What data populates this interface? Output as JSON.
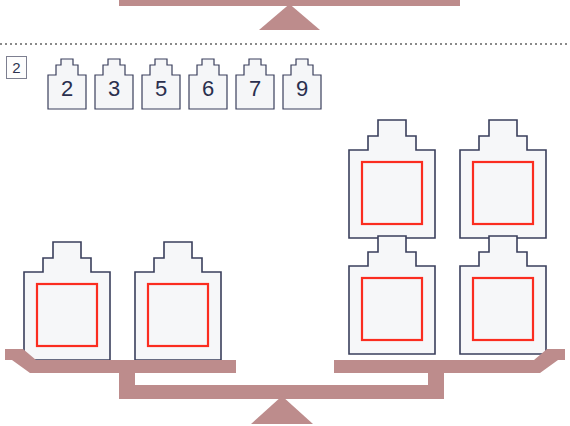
{
  "page": {
    "width": 570,
    "height": 426,
    "background": "#ffffff",
    "type": "math-worksheet-balance-puzzle"
  },
  "colors": {
    "beam": "#bd8c8c",
    "weight_outline": "#3a3f5c",
    "weight_fill": "#f6f7f9",
    "inner_square": "#fb2d20",
    "separator": "#8a8a8a",
    "number_text": "#2a2f4e"
  },
  "previous_exercise": {
    "label": "cut-off-balance-from-previous-question",
    "visible": "bottom of beam and fulcrum only"
  },
  "separator": {
    "style": "dotted-horizontal-rule"
  },
  "question": {
    "number": "2"
  },
  "number_tiles": [
    {
      "value": "2"
    },
    {
      "value": "3"
    },
    {
      "value": "5"
    },
    {
      "value": "6"
    },
    {
      "value": "7"
    },
    {
      "value": "9"
    }
  ],
  "balance": {
    "fulcrum": "triangle",
    "left_pan": {
      "name": "left-pan",
      "weight_count": 2,
      "stacks": [
        {
          "name": "left-stack-1",
          "height": 1,
          "weights": [
            {
              "value": ""
            }
          ]
        },
        {
          "name": "left-stack-2",
          "height": 1,
          "weights": [
            {
              "value": ""
            }
          ]
        }
      ]
    },
    "right_pan": {
      "name": "right-pan",
      "weight_count": 4,
      "stacks": [
        {
          "name": "right-stack-1",
          "height": 2,
          "weights": [
            {
              "value": ""
            },
            {
              "value": ""
            }
          ]
        },
        {
          "name": "right-stack-2",
          "height": 2,
          "weights": [
            {
              "value": ""
            },
            {
              "value": ""
            }
          ]
        }
      ]
    },
    "state": "level"
  }
}
